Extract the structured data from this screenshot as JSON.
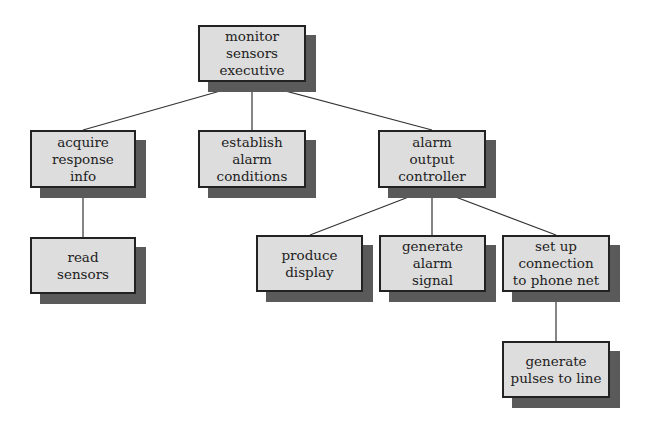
{
  "diagram": {
    "type": "hierarchy-chart",
    "colors": {
      "box_fill": "#dddddd",
      "box_border": "#222222",
      "shadow": "#5a5a5a",
      "line": "#333333"
    },
    "nodes": [
      {
        "id": "monitor",
        "label": "monitor\nsensors\nexecutive",
        "x": 198,
        "y": 25,
        "w": 108,
        "h": 57
      },
      {
        "id": "acquire",
        "label": "acquire\nresponse\ninfo",
        "x": 30,
        "y": 130,
        "w": 106,
        "h": 58
      },
      {
        "id": "establish",
        "label": "establish\nalarm\nconditions",
        "x": 198,
        "y": 130,
        "w": 108,
        "h": 58
      },
      {
        "id": "alarm",
        "label": "alarm\noutput\ncontroller",
        "x": 378,
        "y": 130,
        "w": 108,
        "h": 58
      },
      {
        "id": "read",
        "label": "read\nsensors",
        "x": 30,
        "y": 237,
        "w": 106,
        "h": 57
      },
      {
        "id": "produce",
        "label": "produce\ndisplay",
        "x": 256,
        "y": 235,
        "w": 107,
        "h": 57
      },
      {
        "id": "generate_alarm",
        "label": "generate\nalarm\nsignal",
        "x": 379,
        "y": 235,
        "w": 107,
        "h": 57
      },
      {
        "id": "setup",
        "label": "set up\nconnection\nto phone net",
        "x": 502,
        "y": 235,
        "w": 108,
        "h": 57
      },
      {
        "id": "pulses",
        "label": "generate\npulses to line",
        "x": 502,
        "y": 341,
        "w": 108,
        "h": 57
      }
    ],
    "edges": [
      {
        "from": "monitor",
        "to": "acquire"
      },
      {
        "from": "monitor",
        "to": "establish"
      },
      {
        "from": "monitor",
        "to": "alarm"
      },
      {
        "from": "acquire",
        "to": "read"
      },
      {
        "from": "alarm",
        "to": "produce"
      },
      {
        "from": "alarm",
        "to": "generate_alarm"
      },
      {
        "from": "alarm",
        "to": "setup"
      },
      {
        "from": "setup",
        "to": "pulses"
      }
    ]
  }
}
